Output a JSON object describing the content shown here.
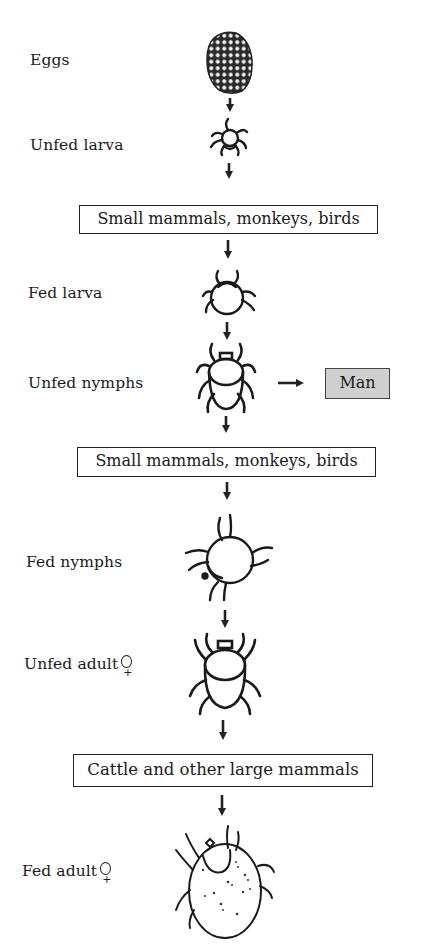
{
  "diagram": {
    "type": "life-cycle-flow",
    "stages": [
      {
        "id": "eggs",
        "label": "Eggs",
        "icon": "egg-mass-icon"
      },
      {
        "id": "unfed-larva",
        "label": "Unfed larva",
        "icon": "larva-icon"
      },
      {
        "id": "fed-larva",
        "label": "Fed larva",
        "icon": "fed-larva-icon"
      },
      {
        "id": "unfed-nymphs",
        "label": "Unfed nymphs",
        "icon": "nymph-icon"
      },
      {
        "id": "fed-nymphs",
        "label": "Fed nymphs",
        "icon": "fed-nymph-icon"
      },
      {
        "id": "unfed-adult-female",
        "label": "Unfed adult",
        "sex_symbol": "♀",
        "icon": "adult-tick-icon"
      },
      {
        "id": "fed-adult-female",
        "label": "Fed adult",
        "sex_symbol": "♀",
        "icon": "engorged-tick-icon"
      }
    ],
    "hosts": [
      {
        "id": "host-1",
        "label": "Small mammals, monkeys, birds"
      },
      {
        "id": "host-2",
        "label": "Small mammals, monkeys, birds"
      },
      {
        "id": "host-3",
        "label": "Cattle and other large mammals"
      }
    ],
    "side_host": {
      "label": "Man",
      "fill": "#cfcfcf",
      "from": "unfed-nymphs"
    },
    "flow": [
      "eggs",
      "unfed-larva",
      "host-1",
      "fed-larva",
      "unfed-nymphs",
      "host-2",
      "fed-nymphs",
      "unfed-adult-female",
      "host-3",
      "fed-adult-female"
    ]
  }
}
